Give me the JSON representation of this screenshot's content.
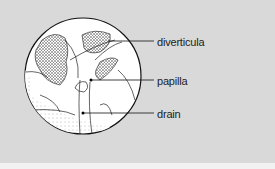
{
  "figure": {
    "background": "#d9d9d9",
    "circle_fill": "#ffffff",
    "ink": "#1a1a1a",
    "labels": [
      {
        "text": "diverticula",
        "y": 36
      },
      {
        "text": "papilla",
        "y": 76
      },
      {
        "text": "drain",
        "y": 110
      }
    ]
  }
}
